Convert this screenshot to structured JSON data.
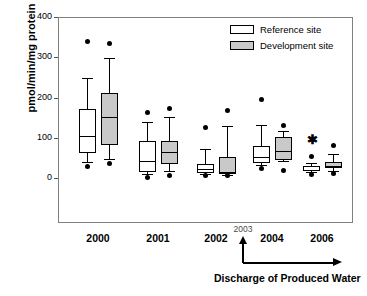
{
  "chart_data": {
    "type": "boxplot",
    "title": "",
    "xlabel": "Discharge of Produced Water",
    "ylabel": "pmol/min/mg protein",
    "ylim": [
      0,
      400
    ],
    "yticks": [
      0,
      100,
      200,
      300,
      400
    ],
    "ytick_labels": [
      "0",
      "100",
      "200",
      "300",
      "400"
    ],
    "grid": false,
    "legend_position": "top-right",
    "categories": [
      "2000",
      "2001",
      "2002",
      "2004",
      "2006"
    ],
    "axis_annotation": {
      "label": "2003",
      "note": "Discharge of Produced Water"
    },
    "significance_marker": {
      "symbol": "✱",
      "group": "2006",
      "series": "Reference site",
      "value": 95
    },
    "series": [
      {
        "name": "Reference site",
        "color": "#ffffff",
        "edge_color": "#000000",
        "boxes": [
          {
            "category": "2000",
            "whisker_low": 40,
            "q1": 63,
            "median": 104,
            "q3": 171,
            "whisker_high": 250,
            "outliers": [
              28,
              340
            ]
          },
          {
            "category": "2001",
            "whisker_low": 10,
            "q1": 15,
            "median": 42,
            "q3": 93,
            "whisker_high": 140,
            "outliers": [
              2,
              164
            ]
          },
          {
            "category": "2002",
            "whisker_low": 10,
            "q1": 12,
            "median": 22,
            "q3": 35,
            "whisker_high": 72,
            "outliers": [
              5,
              125
            ]
          },
          {
            "category": "2004",
            "whisker_low": 32,
            "q1": 38,
            "median": 53,
            "q3": 79,
            "whisker_high": 133,
            "outliers": [
              23,
              195
            ]
          },
          {
            "category": "2006",
            "whisker_low": 15,
            "q1": 17,
            "median": 21,
            "q3": 30,
            "whisker_high": 37,
            "outliers": [
              9,
              53
            ]
          }
        ]
      },
      {
        "name": "Development site",
        "color": "#c8c8c8",
        "edge_color": "#000000",
        "boxes": [
          {
            "category": "2000",
            "whisker_low": 47,
            "q1": 81,
            "median": 153,
            "q3": 211,
            "whisker_high": 299,
            "outliers": [
              36,
              335
            ]
          },
          {
            "category": "2001",
            "whisker_low": 18,
            "q1": 36,
            "median": 64,
            "q3": 93,
            "whisker_high": 153,
            "outliers": [
              7,
              174
            ]
          },
          {
            "category": "2002",
            "whisker_low": 8,
            "q1": 10,
            "median": 15,
            "q3": 52,
            "whisker_high": 130,
            "outliers": [
              5,
              167
            ]
          },
          {
            "category": "2004",
            "whisker_low": 42,
            "q1": 45,
            "median": 67,
            "q3": 102,
            "whisker_high": 118,
            "outliers": [
              19,
              130
            ]
          },
          {
            "category": "2006",
            "whisker_low": 18,
            "q1": 24,
            "median": 31,
            "q3": 40,
            "whisker_high": 60,
            "outliers": [
              11,
              81
            ]
          }
        ]
      }
    ]
  },
  "legend": {
    "items": [
      {
        "label": "Reference site",
        "swatch": "white-box-swatch"
      },
      {
        "label": "Development site",
        "swatch": "gray-box-swatch"
      }
    ]
  },
  "axis": {
    "y_title": "pmol/min/mg protein",
    "y_tick_labels": [
      "400",
      "300",
      "200",
      "100",
      "0"
    ],
    "x_tick_labels": [
      "2000",
      "2001",
      "2002",
      "2004",
      "2006"
    ],
    "x_inset_label": "2003",
    "x_caption": "Discharge of Produced Water"
  }
}
